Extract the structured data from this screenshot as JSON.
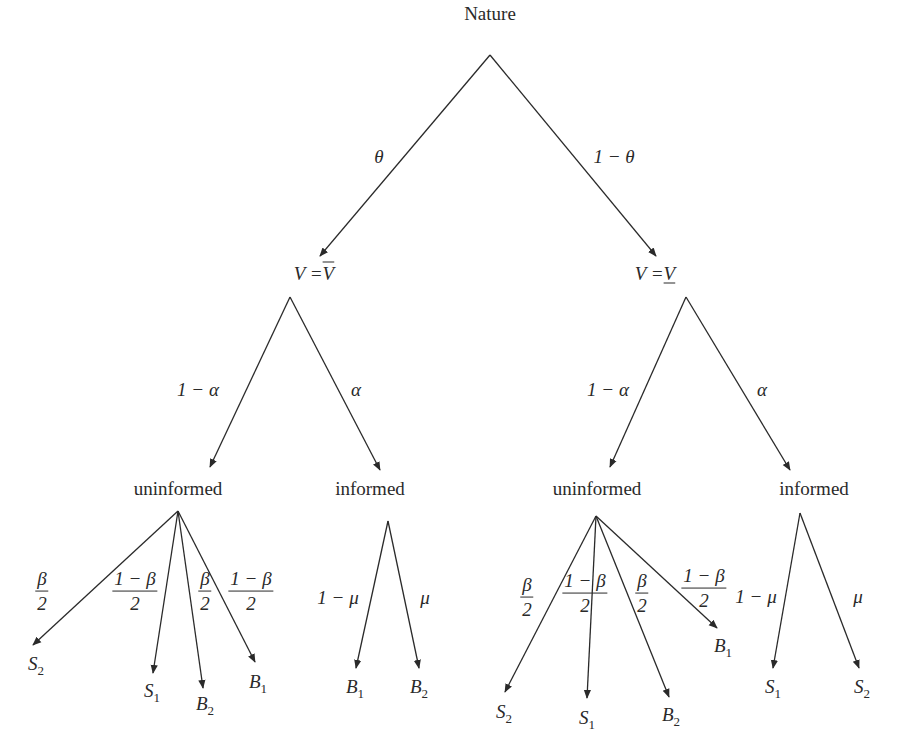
{
  "diagram": {
    "type": "game-tree",
    "root": {
      "label": "Nature"
    },
    "level1": {
      "left": {
        "edge_label": "θ",
        "node_label_lhs": "V =",
        "node_label_rhs": "V",
        "rhs_decoration": "overline"
      },
      "right": {
        "edge_label": "1 − θ",
        "node_label_lhs": "V =",
        "node_label_rhs": "V",
        "rhs_decoration": "underline"
      }
    },
    "level2": {
      "left": {
        "uninformed": {
          "edge_label": "1 − α",
          "label": "uninformed"
        },
        "informed": {
          "edge_label": "α",
          "label": "informed"
        }
      },
      "right": {
        "uninformed": {
          "edge_label": "1 − α",
          "label": "uninformed"
        },
        "informed": {
          "edge_label": "α",
          "label": "informed"
        }
      }
    },
    "leaves": {
      "left_uninformed": [
        {
          "prob_num": "β",
          "prob_den": "2",
          "outcome": "S",
          "sub": "2"
        },
        {
          "prob_num": "1 − β",
          "prob_den": "2",
          "outcome": "S",
          "sub": "1"
        },
        {
          "prob_num": "β",
          "prob_den": "2",
          "outcome": "B",
          "sub": "2"
        },
        {
          "prob_num": "1 − β",
          "prob_den": "2",
          "outcome": "B",
          "sub": "1"
        }
      ],
      "left_informed": [
        {
          "prob": "1 − μ",
          "outcome": "B",
          "sub": "1"
        },
        {
          "prob": "μ",
          "outcome": "B",
          "sub": "2"
        }
      ],
      "right_uninformed": [
        {
          "prob_num": "β",
          "prob_den": "2",
          "outcome": "S",
          "sub": "2"
        },
        {
          "prob_num": "1 − β",
          "prob_den": "2",
          "outcome": "S",
          "sub": "1"
        },
        {
          "prob_num": "β",
          "prob_den": "2",
          "outcome": "B",
          "sub": "2"
        },
        {
          "prob_num": "1 − β",
          "prob_den": "2",
          "outcome": "B",
          "sub": "1"
        }
      ],
      "right_informed": [
        {
          "prob": "1 − μ",
          "outcome": "S",
          "sub": "1"
        },
        {
          "prob": "μ",
          "outcome": "S",
          "sub": "2"
        }
      ]
    },
    "colors": {
      "line": "#2a2a2a",
      "text": "#2a2a2a",
      "background": "#ffffff"
    }
  }
}
